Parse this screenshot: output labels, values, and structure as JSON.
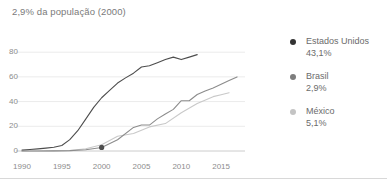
{
  "chart_data": {
    "type": "line",
    "title": "2,9% da população (2000)",
    "xlabel": "",
    "ylabel": "",
    "xlim": [
      1990,
      2018
    ],
    "ylim": [
      0,
      85
    ],
    "yticks": [
      0,
      20,
      40,
      60,
      80
    ],
    "xticks": [
      1990,
      1995,
      2000,
      2005,
      2010,
      2015
    ],
    "grid": true,
    "legend_position": "right",
    "annotation": {
      "label": "2,9% da população (2000)",
      "series": "Brasil",
      "x": 2000,
      "y": 2.9
    },
    "series": [
      {
        "name": "Estados Unidos",
        "value_label": "43,1%",
        "color": "#4d4d4d",
        "x": [
          1990,
          1991,
          1992,
          1993,
          1994,
          1995,
          1996,
          1997,
          1998,
          1999,
          2000,
          2001,
          2002,
          2003,
          2004,
          2005,
          2006,
          2007,
          2008,
          2009,
          2010,
          2011,
          2012
        ],
        "y": [
          0.8,
          1.2,
          1.7,
          2.3,
          3.0,
          4.5,
          9.2,
          16.4,
          25.8,
          35.3,
          43.1,
          49.1,
          55.0,
          59.2,
          63.0,
          68.0,
          69.0,
          71.5,
          74.0,
          76.0,
          74.0,
          76.0,
          78.0
        ]
      },
      {
        "name": "Brasil",
        "value_label": "2,9%",
        "color": "#8c8c8c",
        "x": [
          1990,
          1992,
          1994,
          1996,
          1998,
          2000,
          2002,
          2004,
          2005,
          2006,
          2007,
          2008,
          2009,
          2010,
          2011,
          2012,
          2013,
          2014,
          2015,
          2016,
          2017
        ],
        "y": [
          0.0,
          0.0,
          0.1,
          0.3,
          1.0,
          2.9,
          9.1,
          19.1,
          21.0,
          21.0,
          26.0,
          30.0,
          33.7,
          40.7,
          40.7,
          45.7,
          48.6,
          51.0,
          54.0,
          57.0,
          60.0
        ]
      },
      {
        "name": "México",
        "value_label": "5,1%",
        "color": "#c9c9c9",
        "x": [
          1990,
          1992,
          1994,
          1996,
          1998,
          2000,
          2002,
          2004,
          2006,
          2008,
          2010,
          2012,
          2014,
          2015,
          2016
        ],
        "y": [
          0.0,
          0.0,
          0.1,
          0.4,
          1.8,
          5.1,
          11.9,
          14.1,
          19.5,
          22.2,
          31.0,
          38.4,
          44.0,
          45.6,
          47.2
        ]
      }
    ]
  },
  "legend": {
    "items": [
      {
        "name": "Estados Unidos",
        "value": "43,1%",
        "color": "#333333"
      },
      {
        "name": "Brasil",
        "value": "2,9%",
        "color": "#7d7d7d"
      },
      {
        "name": "México",
        "value": "5,1%",
        "color": "#c4c4c4"
      }
    ]
  }
}
